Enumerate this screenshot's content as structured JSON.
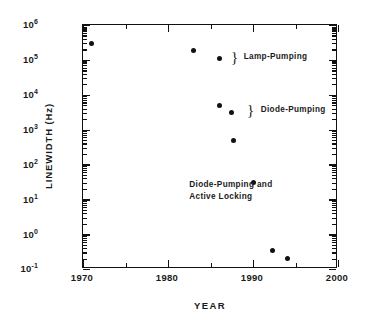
{
  "chart_data": {
    "type": "scatter",
    "title": "",
    "xlabel": "YEAR",
    "ylabel": "LINEWIDTH  (Hz)",
    "xlim": [
      1970,
      2000
    ],
    "ylim": [
      0.1,
      1000000
    ],
    "yscale": "log",
    "xscale": "linear",
    "grid": false,
    "legend": "none",
    "xticks": [
      1970,
      1980,
      1990,
      2000
    ],
    "xtick_labels": [
      "1970",
      "1980",
      "1990",
      "2000"
    ],
    "xticks_minor": [
      1975,
      1985,
      1995
    ],
    "yticks": [
      0.1,
      1,
      10,
      100,
      1000,
      10000,
      100000,
      1000000
    ],
    "ytick_labels": [
      "10-1",
      "100",
      "101",
      "102",
      "103",
      "104",
      "105",
      "106"
    ],
    "ytick_mantissa": [
      "10",
      "10",
      "10",
      "10",
      "10",
      "10",
      "10",
      "10"
    ],
    "ytick_exponent": [
      "-1",
      "0",
      "1",
      "2",
      "3",
      "4",
      "5",
      "6"
    ],
    "points": [
      {
        "x": 1971.0,
        "y": 300000,
        "group": "Lamp-Pumping"
      },
      {
        "x": 1983.0,
        "y": 190000,
        "group": "Lamp-Pumping"
      },
      {
        "x": 1986.0,
        "y": 110000,
        "group": "Lamp-Pumping"
      },
      {
        "x": 1986.0,
        "y": 5000,
        "group": "Diode-Pumping"
      },
      {
        "x": 1987.5,
        "y": 3100,
        "group": "Diode-Pumping"
      },
      {
        "x": 1987.7,
        "y": 500,
        "group": "Diode-Pumping and Active Locking"
      },
      {
        "x": 1990.0,
        "y": 30,
        "group": "Diode-Pumping and Active Locking"
      },
      {
        "x": 1992.3,
        "y": 0.33,
        "group": "Diode-Pumping and Active Locking"
      },
      {
        "x": 1994.1,
        "y": 0.2,
        "group": "Diode-Pumping and Active Locking"
      }
    ],
    "annotations": [
      {
        "name": "lamp-pumping",
        "text": "Lamp-Pumping",
        "brace": "}"
      },
      {
        "name": "diode-pumping",
        "text": "Diode-Pumping",
        "brace": "}"
      },
      {
        "name": "diode-pumping-active-locking-line1",
        "text": "Diode-Pumping  and"
      },
      {
        "name": "diode-pumping-active-locking-line2",
        "text": "Active  Locking"
      }
    ],
    "colors": {
      "marker": "#111111",
      "axis": "#111111",
      "background": "#ffffff",
      "text": "#1a1a1a"
    }
  }
}
